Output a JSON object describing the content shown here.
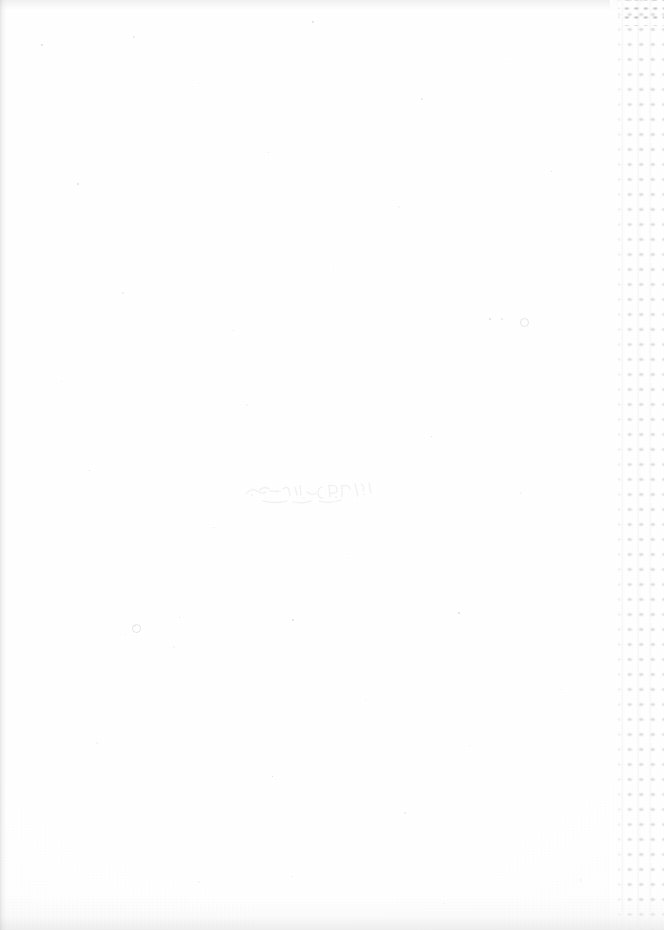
{
  "document": {
    "kind": "scanned-page",
    "page_label": "",
    "body_text": "",
    "center_mark_text": "",
    "width_px": 664,
    "height_px": 930
  },
  "colors": {
    "paper": "#fefefe",
    "dot_grid": "#e4e4e4",
    "edge_shadow": "#b2b2b2",
    "speckle": "#8c8c8c"
  },
  "right_strip": {
    "label": "",
    "pattern": "dot-grid",
    "columns": 4,
    "column_pitch_px": 11.5,
    "row_pitch_px": 15,
    "left_edge_px": 618,
    "width_px": 46
  },
  "speckles": [
    {
      "x": 41,
      "y": 44,
      "size": 2
    },
    {
      "x": 133,
      "y": 36,
      "size": 2
    },
    {
      "x": 199,
      "y": 83,
      "size": 1
    },
    {
      "x": 312,
      "y": 21,
      "size": 2
    },
    {
      "x": 421,
      "y": 98,
      "size": 2
    },
    {
      "x": 506,
      "y": 61,
      "size": 1
    },
    {
      "x": 77,
      "y": 183,
      "size": 2
    },
    {
      "x": 268,
      "y": 152,
      "size": 1
    },
    {
      "x": 398,
      "y": 206,
      "size": 2
    },
    {
      "x": 551,
      "y": 171,
      "size": 1
    },
    {
      "x": 122,
      "y": 292,
      "size": 2
    },
    {
      "x": 333,
      "y": 271,
      "size": 1
    },
    {
      "x": 489,
      "y": 318,
      "size": 2
    },
    {
      "x": 62,
      "y": 381,
      "size": 1
    },
    {
      "x": 246,
      "y": 404,
      "size": 2
    },
    {
      "x": 431,
      "y": 436,
      "size": 1
    },
    {
      "x": 501,
      "y": 318,
      "size": 2
    },
    {
      "x": 134,
      "y": 625,
      "size": 2
    },
    {
      "x": 179,
      "y": 617,
      "size": 1
    },
    {
      "x": 125,
      "y": 634,
      "size": 1
    },
    {
      "x": 173,
      "y": 646,
      "size": 2
    },
    {
      "x": 292,
      "y": 619,
      "size": 2
    },
    {
      "x": 214,
      "y": 527,
      "size": 1
    },
    {
      "x": 347,
      "y": 557,
      "size": 1
    },
    {
      "x": 458,
      "y": 612,
      "size": 2
    },
    {
      "x": 561,
      "y": 689,
      "size": 1
    },
    {
      "x": 96,
      "y": 742,
      "size": 2
    },
    {
      "x": 272,
      "y": 776,
      "size": 1
    },
    {
      "x": 404,
      "y": 812,
      "size": 2
    },
    {
      "x": 198,
      "y": 881,
      "size": 2
    },
    {
      "x": 291,
      "y": 876,
      "size": 1
    },
    {
      "x": 443,
      "y": 903,
      "size": 1
    },
    {
      "x": 580,
      "y": 879,
      "size": 2
    },
    {
      "x": 89,
      "y": 470,
      "size": 1
    },
    {
      "x": 366,
      "y": 700,
      "size": 1
    },
    {
      "x": 520,
      "y": 492,
      "size": 2
    },
    {
      "x": 233,
      "y": 330,
      "size": 1
    },
    {
      "x": 470,
      "y": 745,
      "size": 1
    }
  ],
  "speck_rings": [
    {
      "x": 132,
      "y": 624
    },
    {
      "x": 520,
      "y": 318
    }
  ]
}
